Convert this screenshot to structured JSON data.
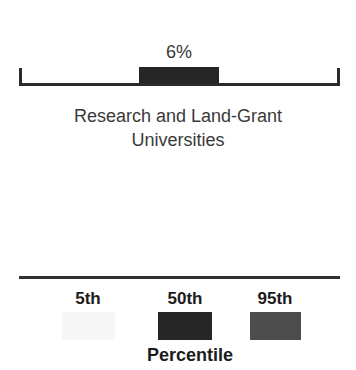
{
  "chart_data": {
    "type": "bar",
    "title": "",
    "xlabel": "",
    "ylabel": "",
    "categories": [
      "Research and Land-Grant Universities"
    ],
    "values": [
      6
    ],
    "value_labels": [
      "6%"
    ],
    "value_unit": "%",
    "orientation": "vertical",
    "grid": false,
    "legend_position": "bottom",
    "legend_title": "Percentile",
    "series": [
      {
        "name": "Percent",
        "values": [
          6
        ],
        "labels": [
          "6%"
        ]
      }
    ],
    "legend_entries": [
      {
        "label": "5th",
        "color": "#f7f7f7",
        "percentile": 5
      },
      {
        "label": "50th",
        "color": "#262626",
        "percentile": 50
      },
      {
        "label": "95th",
        "color": "#4d4d4d",
        "percentile": 95
      }
    ]
  },
  "bar": {
    "value_label": "6%",
    "color": "#262626"
  },
  "category": {
    "line1": "Research and Land-Grant",
    "line2": "Universities"
  },
  "axis": {
    "color": "#2b2b2b"
  },
  "legend": {
    "title": "Percentile",
    "rule_color": "#2f2f2f",
    "items": [
      {
        "label": "5th",
        "color": "#f7f7f7"
      },
      {
        "label": "50th",
        "color": "#262626"
      },
      {
        "label": "95th",
        "color": "#4d4d4d"
      }
    ]
  },
  "colors": {
    "background": "#ffffff",
    "text": "#1c1c1c",
    "text_muted": "#3a3a3a"
  }
}
